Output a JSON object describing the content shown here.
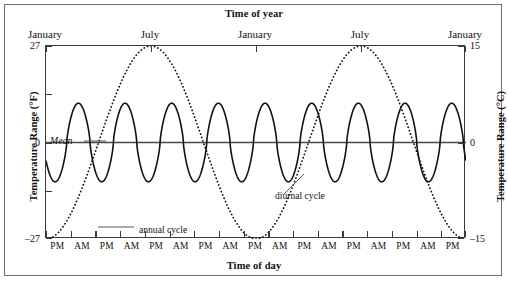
{
  "figure": {
    "top_title": "Time of year",
    "bottom_title": "Time of day"
  },
  "axes": {
    "left": {
      "title": "Temperature Range (°F)",
      "ticks": [
        "27",
        "0",
        "-27"
      ],
      "tick_values": [
        27,
        0,
        -27
      ],
      "minor_tick_values": [
        13.5,
        -13.5
      ]
    },
    "right": {
      "title": "Temperature Range (°C)",
      "ticks": [
        "15",
        "0",
        "-15"
      ],
      "tick_values": [
        15,
        0,
        -15
      ]
    },
    "top": {
      "labels": [
        "January",
        "July",
        "January",
        "July",
        "January"
      ]
    },
    "bottom": {
      "labels": [
        "PM",
        "AM",
        "PM",
        "AM",
        "PM",
        "AM",
        "PM",
        "AM",
        "PM",
        "AM",
        "PM",
        "AM",
        "PM",
        "AM",
        "PM",
        "AM",
        "PM"
      ]
    }
  },
  "annotations": {
    "mean": "Mean",
    "annual": "annual cycle",
    "diurnal": "diurnal cycle"
  },
  "colors": {
    "curve": "#111111",
    "axis": "#3a3a3a",
    "frame": "#6d6d6d",
    "mean_line": "#4a4a4a",
    "background": "#ffffff"
  },
  "chart_data": {
    "type": "line",
    "title": "Time of year",
    "xlabel": "Time of day",
    "ylabel": "Temperature Range (°F)",
    "ylabel_secondary": "Temperature Range (°C)",
    "ylim": [
      -27,
      27
    ],
    "ylim_secondary": [
      -15,
      15
    ],
    "grid": false,
    "legend": "inline annotations",
    "x_top_tick_labels": [
      "January",
      "July",
      "January",
      "July",
      "January"
    ],
    "x_top_tick_positions": [
      0,
      0.25,
      0.5,
      0.75,
      1.0
    ],
    "x_bottom_tick_labels": [
      "PM",
      "AM",
      "PM",
      "AM",
      "PM",
      "AM",
      "PM",
      "AM",
      "PM",
      "AM",
      "PM",
      "AM",
      "PM",
      "AM",
      "PM",
      "AM",
      "PM"
    ],
    "series": [
      {
        "name": "annual cycle",
        "style": "dotted",
        "description": "Sinusoid over two years: minimum -27 °F in January, maximum +27 °F in July",
        "period_fraction_of_axis": 0.5,
        "amplitude_f": 27,
        "mean_f": 0,
        "phase": "minimum at left edge (January)",
        "sample_points": [
          {
            "x": 0.0,
            "y": -27
          },
          {
            "x": 0.0625,
            "y": -19.1
          },
          {
            "x": 0.125,
            "y": 0
          },
          {
            "x": 0.1875,
            "y": 19.1
          },
          {
            "x": 0.25,
            "y": 27
          },
          {
            "x": 0.3125,
            "y": 19.1
          },
          {
            "x": 0.375,
            "y": 0
          },
          {
            "x": 0.4375,
            "y": -19.1
          },
          {
            "x": 0.5,
            "y": -27
          },
          {
            "x": 0.5625,
            "y": -19.1
          },
          {
            "x": 0.625,
            "y": 0
          },
          {
            "x": 0.6875,
            "y": 19.1
          },
          {
            "x": 0.75,
            "y": 27
          },
          {
            "x": 0.8125,
            "y": 19.1
          },
          {
            "x": 0.875,
            "y": 0
          },
          {
            "x": 0.9375,
            "y": -19.1
          },
          {
            "x": 1.0,
            "y": -27
          }
        ]
      },
      {
        "name": "diurnal cycle",
        "style": "solid",
        "description": "High-frequency sinusoid of constant amplitude about the mean; roughly nine daily cycles across the axis",
        "cycles": 9,
        "amplitude_f": 11,
        "mean_f": 0,
        "phase_deg": 200
      },
      {
        "name": "Mean",
        "style": "solid horizontal reference",
        "value_f": 0,
        "value_c": 0
      }
    ]
  }
}
